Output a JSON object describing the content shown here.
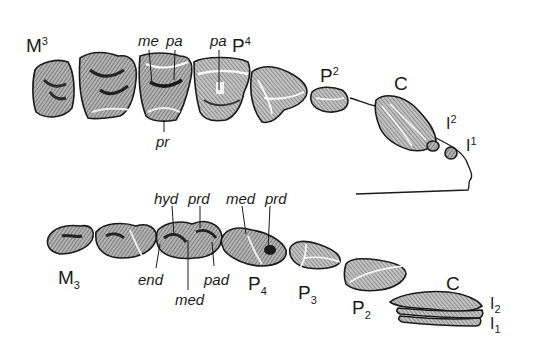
{
  "diagram": {
    "type": "dental-anatomy",
    "upper_row": {
      "teeth": [
        {
          "id": "M3",
          "label": "M",
          "index": "3",
          "position": "upper"
        },
        {
          "id": "M2",
          "label": "",
          "index": "",
          "position": "upper"
        },
        {
          "id": "M1",
          "label": "",
          "index": "",
          "position": "upper"
        },
        {
          "id": "P4",
          "label": "P",
          "index": "4",
          "position": "upper"
        },
        {
          "id": "P3",
          "label": "",
          "index": "",
          "position": "upper"
        },
        {
          "id": "P2",
          "label": "P",
          "index": "2",
          "position": "upper"
        },
        {
          "id": "C",
          "label": "C",
          "index": "",
          "position": "upper"
        },
        {
          "id": "I2",
          "label": "I",
          "index": "2",
          "position": "upper"
        },
        {
          "id": "I1",
          "label": "I",
          "index": "1",
          "position": "upper"
        }
      ],
      "cusp_labels": [
        {
          "text": "me",
          "tooth": "M1"
        },
        {
          "text": "pa",
          "tooth": "M1"
        },
        {
          "text": "pr",
          "tooth": "M1"
        },
        {
          "text": "pa",
          "tooth": "P4"
        }
      ]
    },
    "lower_row": {
      "teeth": [
        {
          "id": "M3",
          "label": "M",
          "index": "3",
          "position": "lower"
        },
        {
          "id": "M2",
          "label": "",
          "index": "",
          "position": "lower"
        },
        {
          "id": "M1",
          "label": "",
          "index": "",
          "position": "lower"
        },
        {
          "id": "P4",
          "label": "P",
          "index": "4",
          "position": "lower"
        },
        {
          "id": "P3",
          "label": "P",
          "index": "3",
          "position": "lower"
        },
        {
          "id": "P2",
          "label": "P",
          "index": "2",
          "position": "lower"
        },
        {
          "id": "C",
          "label": "C",
          "index": "",
          "position": "lower"
        },
        {
          "id": "I2",
          "label": "I",
          "index": "2",
          "position": "lower"
        },
        {
          "id": "I1",
          "label": "I",
          "index": "1",
          "position": "lower"
        }
      ],
      "cusp_labels": [
        {
          "text": "hyd",
          "tooth": "M1"
        },
        {
          "text": "prd",
          "tooth": "M1"
        },
        {
          "text": "end",
          "tooth": "M1"
        },
        {
          "text": "med",
          "tooth": "M1"
        },
        {
          "text": "pad",
          "tooth": "M1"
        },
        {
          "text": "med",
          "tooth": "P4"
        },
        {
          "text": "prd",
          "tooth": "P4"
        }
      ]
    }
  },
  "colors": {
    "ink": "#1a1a1a",
    "fill": "#8c8c8c",
    "dark_fill": "#3a3a3a",
    "background": "#ffffff"
  }
}
